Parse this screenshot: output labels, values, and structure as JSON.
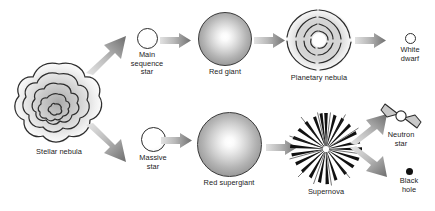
{
  "diagram": {
    "background_color": "#ffffff",
    "text_color": "#1b1b1b",
    "arrow_color_light": "#cfcfcf",
    "arrow_color_dark": "#6e6e6e"
  },
  "stages": {
    "stellar_nebula": {
      "label": "Stellar nebula",
      "icon": "nebula-cloud-icon"
    },
    "main_sequence_star": {
      "label": "Main\nsequence\nstar",
      "icon": "small-open-circle-icon"
    },
    "red_giant": {
      "label": "Red giant",
      "icon": "gradient-sphere-icon"
    },
    "planetary_nebula": {
      "label": "Planetary nebula",
      "icon": "planetary-nebula-icon"
    },
    "white_dwarf": {
      "label": "White\ndwarf",
      "icon": "tiny-open-circle-icon"
    },
    "massive_star": {
      "label": "Massive\nstar",
      "icon": "small-open-circle-icon"
    },
    "red_supergiant": {
      "label": "Red supergiant",
      "icon": "gradient-sphere-icon"
    },
    "supernova": {
      "label": "Supernova",
      "icon": "starburst-icon"
    },
    "neutron_star": {
      "label": "Neutron\nstar",
      "icon": "pulsar-icon"
    },
    "black_hole": {
      "label": "Black\nhole",
      "icon": "filled-dot-icon"
    }
  },
  "arrows": [
    {
      "name": "nebula-to-main-sequence",
      "from": "stellar_nebula",
      "to": "main_sequence_star"
    },
    {
      "name": "main-sequence-to-red-giant",
      "from": "main_sequence_star",
      "to": "red_giant"
    },
    {
      "name": "red-giant-to-planetary-nebula",
      "from": "red_giant",
      "to": "planetary_nebula"
    },
    {
      "name": "planetary-nebula-to-white-dwarf",
      "from": "planetary_nebula",
      "to": "white_dwarf"
    },
    {
      "name": "nebula-to-massive-star",
      "from": "stellar_nebula",
      "to": "massive_star"
    },
    {
      "name": "massive-star-to-red-supergiant",
      "from": "massive_star",
      "to": "red_supergiant"
    },
    {
      "name": "red-supergiant-to-supernova",
      "from": "red_supergiant",
      "to": "supernova"
    },
    {
      "name": "supernova-to-neutron-star",
      "from": "supernova",
      "to": "neutron_star"
    },
    {
      "name": "supernova-to-black-hole",
      "from": "supernova",
      "to": "black_hole"
    }
  ]
}
